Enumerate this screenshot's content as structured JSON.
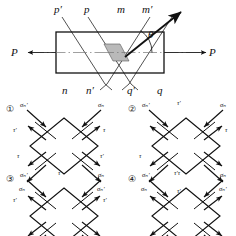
{
  "figure": {
    "title_present": false,
    "top_diagram": {
      "name": "axially-loaded-bar-with-oblique-planes",
      "load_label_left": "P",
      "load_label_right": "P",
      "angle_label": "θ",
      "top_plane_labels": [
        "p′",
        "p",
        "m",
        "m′"
      ],
      "bottom_plane_labels": [
        "n",
        "n′",
        "q′",
        "q"
      ],
      "shaded_element": "parallelogram",
      "normal_arrow": "inclined-normal-arrow"
    },
    "options": [
      {
        "number": "①",
        "top_left": "σₙ′",
        "top_center": "",
        "top_right": "σₙ",
        "mid_left": "τ′",
        "mid_right": "τ",
        "low_left": "τ",
        "low_right": "τ′",
        "bottom_left": "σₙ",
        "bottom_center": "",
        "bottom_right": "σₙ′"
      },
      {
        "number": "②",
        "top_left": "σₙ′",
        "top_center": "τ′",
        "top_right": "σₙ",
        "mid_left": "",
        "mid_right": "τ",
        "low_left": "τ",
        "low_right": "",
        "bottom_left": "σₙ",
        "bottom_center": "τ′",
        "bottom_right": "σₙ′"
      },
      {
        "number": "③",
        "top_left": "σₙ′",
        "top_center": "τ",
        "top_right": "σₙ",
        "mid_left": "τ′",
        "mid_right": "τ′",
        "low_left": "",
        "low_right": "",
        "bottom_left": "",
        "bottom_center": "",
        "bottom_right": ""
      },
      {
        "number": "④",
        "top_left": "σₙ′",
        "top_center": "τ′τ",
        "top_right": "σₙ",
        "mid_left": "",
        "mid_right": "",
        "low_left": "",
        "low_right": "",
        "bottom_left": "",
        "bottom_center": "",
        "bottom_right": ""
      }
    ]
  },
  "colors": {
    "ink": "#111111",
    "shade": "#b9b9b9",
    "axis": "#777777"
  }
}
